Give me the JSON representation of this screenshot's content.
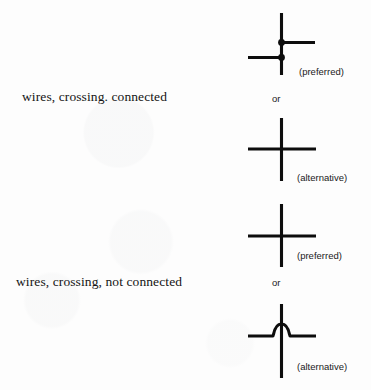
{
  "figure": {
    "kind": "electrical-schematic-symbol-reference",
    "background_color": "#ffffff",
    "ink_color": "#000000",
    "rows": [
      {
        "id": "connected",
        "label": "wires, crossing. connected",
        "conjunction": "or",
        "variants": [
          {
            "id": "connected-preferred",
            "note": "(preferred)",
            "symbol": "staggered-tee-junction-with-dots"
          },
          {
            "id": "connected-alternative",
            "note": "(alternative)",
            "symbol": "plain-cross"
          }
        ]
      },
      {
        "id": "not-connected",
        "label": "wires, crossing, not connected",
        "conjunction": "or",
        "variants": [
          {
            "id": "not-connected-preferred",
            "note": "(preferred)",
            "symbol": "plain-cross"
          },
          {
            "id": "not-connected-alternative",
            "note": "(alternative)",
            "symbol": "crossover-hop-bridge"
          }
        ]
      }
    ]
  }
}
